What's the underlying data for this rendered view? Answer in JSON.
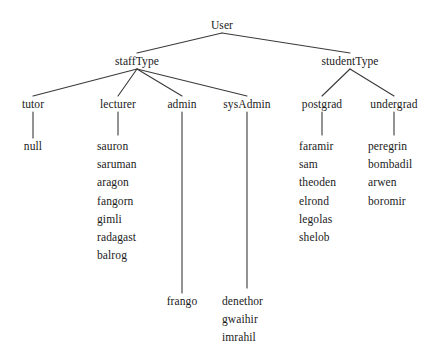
{
  "diagram": {
    "type": "tree",
    "root": {
      "label": "User",
      "x": 222,
      "y": 26
    },
    "level1": [
      {
        "label": "staffType",
        "x": 137,
        "y": 62
      },
      {
        "label": "studentType",
        "x": 350,
        "y": 62
      }
    ],
    "level2": [
      {
        "label": "tutor",
        "x": 33,
        "y": 105
      },
      {
        "label": "lecturer",
        "x": 118,
        "y": 105
      },
      {
        "label": "admin",
        "x": 182,
        "y": 105
      },
      {
        "label": "sysAdmin",
        "x": 247,
        "y": 105
      },
      {
        "label": "postgrad",
        "x": 322,
        "y": 105
      },
      {
        "label": "undergrad",
        "x": 394,
        "y": 105
      }
    ],
    "leaves": {
      "tutor": {
        "x": 33,
        "y": 146,
        "align": "center",
        "items": [
          "null"
        ]
      },
      "lecturer": {
        "x": 97,
        "y": 140,
        "align": "left",
        "items": [
          "sauron",
          "saruman",
          "aragon",
          "fangorn",
          "gimli",
          "radagast",
          "balrog"
        ]
      },
      "admin": {
        "x": 182,
        "y": 300,
        "align": "center",
        "items": [
          "frango"
        ]
      },
      "sysAdmin": {
        "x": 222,
        "y": 295,
        "align": "left",
        "items": [
          "denethor",
          "gwaihir",
          "imrahil"
        ]
      },
      "postgrad": {
        "x": 299,
        "y": 140,
        "align": "left",
        "items": [
          "faramir",
          "sam",
          "theoden",
          "elrond",
          "legolas",
          "shelob"
        ]
      },
      "undergrad": {
        "x": 368,
        "y": 140,
        "align": "left",
        "items": [
          "peregrin",
          "bombadil",
          "arwen",
          "boromir"
        ]
      }
    },
    "style": {
      "line_color": "#3a3a3a",
      "line_width": 1.1,
      "text_color": "#1a1a1a",
      "background": "#ffffff"
    }
  }
}
